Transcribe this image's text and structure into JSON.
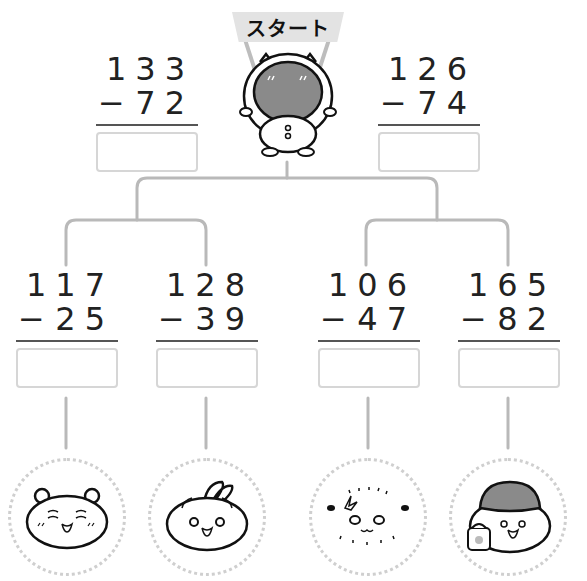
{
  "start_label": "スタート",
  "top_problems": [
    {
      "minuend": "133",
      "subtrahend": "72",
      "operator": "−",
      "answer": ""
    },
    {
      "minuend": "126",
      "subtrahend": "74",
      "operator": "−",
      "answer": ""
    }
  ],
  "bottom_problems": [
    {
      "minuend": "117",
      "subtrahend": "25",
      "operator": "−",
      "answer": ""
    },
    {
      "minuend": "128",
      "subtrahend": "39",
      "operator": "−",
      "answer": ""
    },
    {
      "minuend": "106",
      "subtrahend": "47",
      "operator": "−",
      "answer": ""
    },
    {
      "minuend": "165",
      "subtrahend": "82",
      "operator": "−",
      "answer": ""
    }
  ],
  "characters": [
    "bear-face-icon",
    "rabbit-face-icon",
    "seal-face-icon",
    "helmet-character-icon"
  ],
  "colors": {
    "line": "#b9b9b9",
    "box_border": "#d6d6d6",
    "helmet": "#8a8a8a",
    "banner": "#e3e3e3"
  }
}
